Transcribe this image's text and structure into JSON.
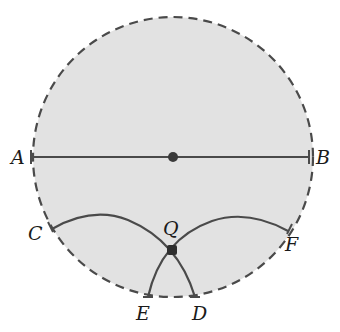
{
  "diagram": {
    "type": "geometric-construction",
    "circle": {
      "cx": 173,
      "cy": 157,
      "r": 140,
      "fill": "#e2e2e2",
      "stroke": "#4a4a4a",
      "style": "dashed"
    },
    "center_point": {
      "x": 173,
      "y": 157
    },
    "diameter": {
      "from": "A",
      "to": "B"
    },
    "points": {
      "A": {
        "label": "A",
        "x": 31,
        "y": 157
      },
      "B": {
        "label": "B",
        "x": 309,
        "y": 157
      },
      "C": {
        "label": "C",
        "x": 52,
        "y": 229
      },
      "D": {
        "label": "D",
        "x": 195,
        "y": 297
      },
      "E": {
        "label": "E",
        "x": 148,
        "y": 297
      },
      "F": {
        "label": "F",
        "x": 288,
        "y": 231
      },
      "Q": {
        "label": "Q",
        "x": 172,
        "y": 250
      }
    },
    "arcs": [
      {
        "name": "arc-C-Q-D",
        "through": [
          "C",
          "Q",
          "D"
        ]
      },
      {
        "name": "arc-F-Q-E",
        "through": [
          "F",
          "Q",
          "E"
        ]
      }
    ],
    "colors": {
      "line": "#4a4a4a",
      "fill": "#e2e2e2",
      "text": "#1a1a1a"
    }
  }
}
